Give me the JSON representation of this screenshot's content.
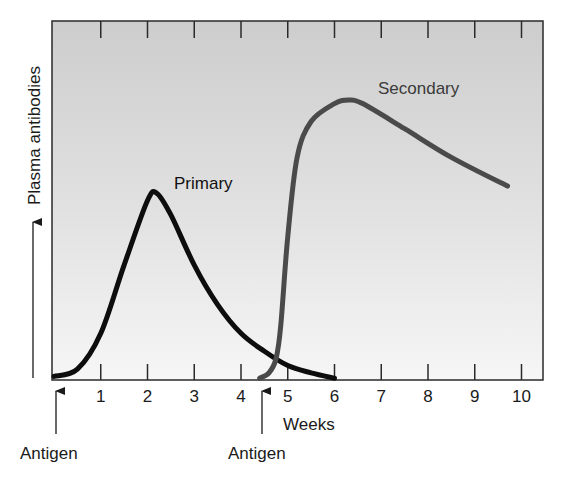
{
  "chart_data": {
    "type": "line",
    "title": "",
    "xlabel": "Weeks",
    "ylabel": "Plasma antibodies",
    "xlim": [
      0,
      10.5
    ],
    "ylim": [
      0,
      100
    ],
    "y_units": "relative (no numeric ticks shown)",
    "x_ticks": [
      1,
      2,
      3,
      4,
      5,
      6,
      7,
      8,
      9,
      10
    ],
    "x_tick_labels": [
      "1",
      "2",
      "3",
      "4",
      "5",
      "6",
      "7",
      "8",
      "9",
      "10"
    ],
    "grid": false,
    "legend": "inline labels",
    "series": [
      {
        "name": "Primary",
        "color": "#0d0d0d",
        "x": [
          0,
          0.5,
          1.0,
          1.5,
          2.0,
          2.2,
          2.5,
          3.0,
          3.5,
          4.0,
          4.5,
          5.0,
          5.5,
          6.0
        ],
        "values": [
          1,
          3,
          13,
          32,
          50,
          52,
          46,
          32,
          21,
          13,
          8,
          4,
          2,
          0.5
        ]
      },
      {
        "name": "Secondary",
        "color": "#4a4a4a",
        "x": [
          4.4,
          4.6,
          4.75,
          4.85,
          5.0,
          5.2,
          5.5,
          6.0,
          6.3,
          6.6,
          7.5,
          8.5,
          9.7
        ],
        "values": [
          0.5,
          2,
          6,
          15,
          40,
          62,
          72,
          77,
          78,
          77,
          70,
          62,
          54
        ]
      }
    ],
    "annotations": [
      {
        "text": "Antigen",
        "x": 0,
        "type": "arrow-up",
        "note": "first antigen exposure"
      },
      {
        "text": "Antigen",
        "x": 4.5,
        "type": "arrow-up",
        "note": "second antigen exposure"
      },
      {
        "text": "Primary",
        "near_series": "Primary"
      },
      {
        "text": "Secondary",
        "near_series": "Secondary"
      }
    ]
  },
  "labels": {
    "ylabel": "Plasma antibodies",
    "xlabel": "Weeks",
    "primary": "Primary",
    "secondary": "Secondary",
    "antigen_1": "Antigen",
    "antigen_2": "Antigen"
  },
  "ticks": [
    "1",
    "2",
    "3",
    "4",
    "5",
    "6",
    "7",
    "8",
    "9",
    "10"
  ],
  "colors": {
    "plot_bg_top": "#cfcfcf",
    "plot_bg_bottom": "#f4f4f4",
    "frame": "#2a2a2a",
    "primary": "#0d0d0d",
    "secondary": "#4a4a4a"
  }
}
